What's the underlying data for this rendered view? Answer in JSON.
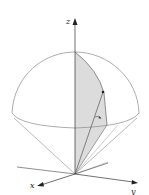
{
  "figure": {
    "colors": {
      "line": "#8a8a8a",
      "axis": "#333333",
      "shade": "#d9d9d9",
      "point": "#222222"
    },
    "axes": {
      "z_label": "z",
      "x_label": "x",
      "y_label": "y"
    },
    "annotations": {
      "point": "marked point on sphere surface",
      "angle_marker": "small angle arc near the edge of wedge"
    }
  }
}
